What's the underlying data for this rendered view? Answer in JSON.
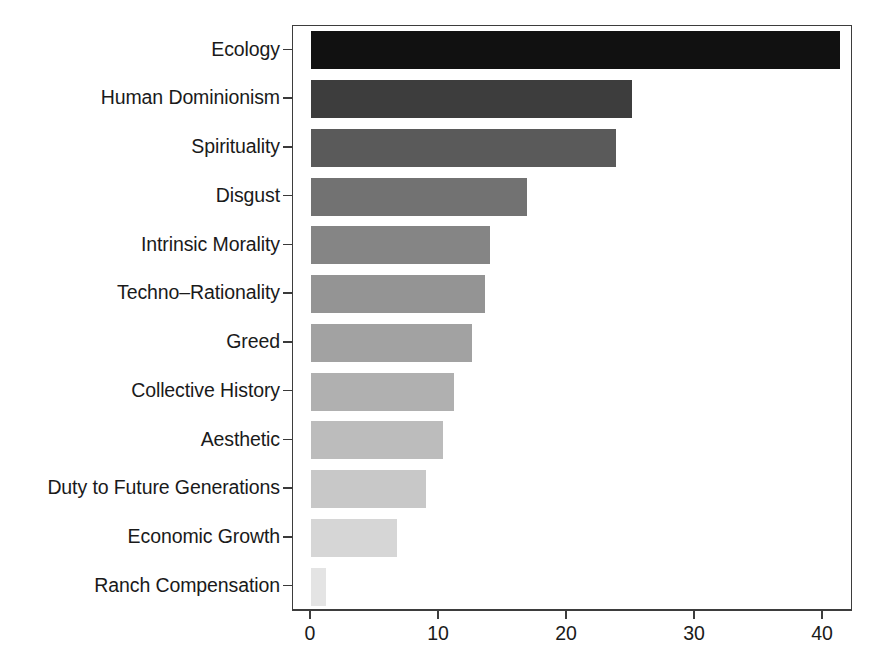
{
  "chart_data": {
    "type": "bar",
    "orientation": "horizontal",
    "title": "",
    "subtitle": "",
    "xlabel": "",
    "ylabel": "",
    "xlim": [
      0,
      43.75
    ],
    "xticks": [
      0,
      10,
      20,
      30,
      40
    ],
    "xtick_labels": [
      "0",
      "10",
      "20",
      "30",
      "40"
    ],
    "grid": false,
    "legend": "none",
    "categories": [
      "Ecology",
      "Human Dominionism",
      "Spirituality",
      "Disgust",
      "Intrinsic Morality",
      "Techno–Rationality",
      "Greed",
      "Collective History",
      "Aesthetic",
      "Duty to Future Generations",
      "Economic Growth",
      "Ranch Compensation"
    ],
    "values": [
      41.3,
      25.1,
      23.8,
      16.9,
      14.0,
      13.6,
      12.6,
      11.2,
      10.3,
      9.0,
      6.7,
      1.2
    ],
    "bar_colors": [
      "#111111",
      "#3d3d3d",
      "#5a5a5a",
      "#727272",
      "#858585",
      "#949494",
      "#a2a2a2",
      "#b0b0b0",
      "#bcbcbc",
      "#c8c8c8",
      "#d6d6d6",
      "#e4e4e4"
    ]
  },
  "axis": {
    "frame_color": "#3d3d3d",
    "tick_color": "#3d3d3d",
    "text_color": "#1a1a1a"
  }
}
